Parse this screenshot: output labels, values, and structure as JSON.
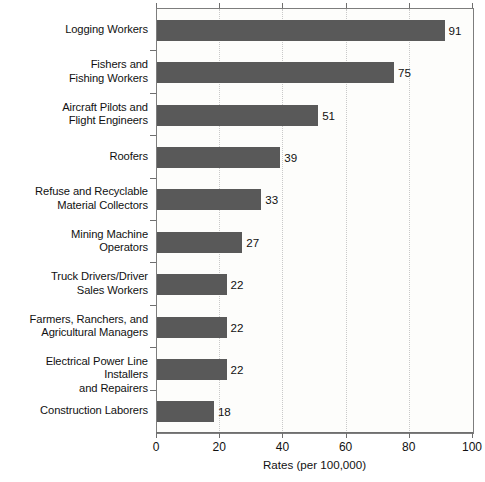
{
  "chart_data": {
    "type": "bar",
    "orientation": "horizontal",
    "title": "",
    "xlabel": "Rates (per 100,000)",
    "ylabel": "",
    "xlim": [
      0,
      100
    ],
    "xticks": [
      0,
      20,
      40,
      60,
      80,
      100
    ],
    "xtick_labels": [
      "0",
      "20",
      "40",
      "60",
      "80",
      "100"
    ],
    "grid": true,
    "grid_axis": "x",
    "legend": false,
    "bar_color": "#595959",
    "plot_background": "#fdfdfb",
    "categories": [
      "Logging Workers",
      "Fishers and\nFishing Workers",
      "Aircraft Pilots and\nFlight Engineers",
      "Roofers",
      "Refuse and Recyclable\nMaterial Collectors",
      "Mining Machine\nOperators",
      "Truck Drivers/Driver\nSales Workers",
      "Farmers, Ranchers, and\nAgricultural Managers",
      "Electrical Power Line Installers\nand Repairers",
      "Construction Laborers"
    ],
    "values": [
      91,
      75,
      51,
      39,
      33,
      27,
      22,
      22,
      22,
      18
    ],
    "value_labels": [
      "91",
      "75",
      "51",
      "39",
      "33",
      "27",
      "22",
      "22",
      "22",
      "18"
    ]
  }
}
